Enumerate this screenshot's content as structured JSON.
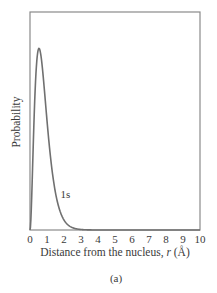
{
  "figure": {
    "caption": "(a)"
  },
  "chart_data": {
    "type": "line",
    "title": "",
    "xlabel": "Distance from the nucleus, r (Å)",
    "xlabel_prefix": "Distance from the nucleus, ",
    "xlabel_var": "r",
    "xlabel_unit": " (Å)",
    "ylabel": "Probability",
    "xlim": [
      0,
      10
    ],
    "ylim": [
      0,
      1.2
    ],
    "x_ticks": [
      0,
      1,
      2,
      3,
      4,
      5,
      6,
      7,
      8,
      9,
      10
    ],
    "y_ticks": [],
    "grid": false,
    "legend": "none",
    "series": [
      {
        "name": "1s",
        "label": "1s",
        "label_position": {
          "x": 1.8,
          "y": 0.2
        },
        "color": "#707070",
        "x": [
          0,
          0.1,
          0.2,
          0.3,
          0.4,
          0.5,
          0.53,
          0.6,
          0.7,
          0.8,
          0.9,
          1.0,
          1.2,
          1.4,
          1.6,
          1.8,
          2.0,
          2.2,
          2.5,
          3.0,
          3.5,
          4.0,
          5.0,
          6.0,
          7.0,
          8.0,
          9.0,
          10.0
        ],
        "values": [
          0.0,
          0.18,
          0.51,
          0.8,
          0.96,
          1.0,
          1.0,
          0.98,
          0.91,
          0.81,
          0.7,
          0.59,
          0.4,
          0.25,
          0.15,
          0.09,
          0.05,
          0.03,
          0.01,
          0.002,
          0.0004,
          0.0001,
          0.0,
          0.0,
          0.0,
          0.0,
          0.0,
          0.0
        ]
      }
    ],
    "annotations": [
      {
        "text": "1s",
        "attached_to": "1s"
      }
    ]
  }
}
